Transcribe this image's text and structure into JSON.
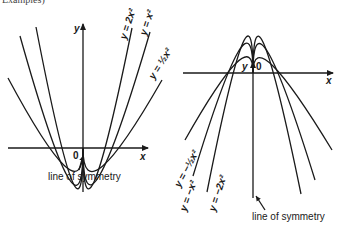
{
  "header": {
    "fragment": "Examples)"
  },
  "left_graph": {
    "name": "upward parabolas",
    "y_axis_label": "y",
    "x_axis_label": "x",
    "origin_label": "0",
    "curves": [
      {
        "label": "y = 2x²",
        "coefficient": 2
      },
      {
        "label": "y = x²",
        "coefficient": 1
      },
      {
        "label": "y = ½x²",
        "coefficient": 0.5
      }
    ],
    "annotation": "line of symmetry"
  },
  "right_graph": {
    "name": "downward parabolas",
    "y_axis_label": "y",
    "x_axis_label": "x",
    "origin_label": "0",
    "curves": [
      {
        "label": "y = −½x²",
        "coefficient": -0.5
      },
      {
        "label": "y = −x²",
        "coefficient": -1
      },
      {
        "label": "y = −2x²",
        "coefficient": -2
      }
    ],
    "annotation": "line of symmetry"
  },
  "colors": {
    "ink": "#1a1a1a",
    "background": "#ffffff"
  }
}
